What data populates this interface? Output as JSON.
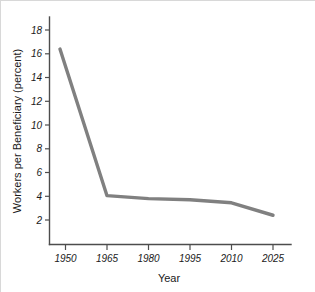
{
  "chart_data": {
    "type": "line",
    "title": "",
    "subtitle": "",
    "xlabel": "Year",
    "ylabel": "Workers per Beneficiary (percent)",
    "x": [
      1948,
      1965,
      1980,
      1995,
      2010,
      2025
    ],
    "values": [
      16.4,
      4.05,
      3.8,
      3.7,
      3.45,
      2.4
    ],
    "series": [
      {
        "name": "Workers per Beneficiary",
        "values": [
          16.4,
          4.05,
          3.8,
          3.7,
          3.45,
          2.4
        ]
      }
    ],
    "xtick_labels": [
      "1950",
      "1965",
      "1980",
      "1995",
      "2010",
      "2025"
    ],
    "xtick_values": [
      1950,
      1965,
      1980,
      1995,
      2010,
      2025
    ],
    "ytick_labels": [
      "2",
      "4",
      "6",
      "8",
      "10",
      "12",
      "14",
      "16",
      "18"
    ],
    "ytick_values": [
      2,
      4,
      6,
      8,
      10,
      12,
      14,
      16,
      18
    ],
    "xlim": [
      1943,
      2033
    ],
    "ylim": [
      0,
      19
    ],
    "grid": false,
    "legend": false,
    "legend_position": "none",
    "line_color": "#808080",
    "line_width": 3.4,
    "axis_color": "#4d4d4d",
    "background_color": "#ffffff",
    "border_color": "#d8d8d8"
  },
  "ytick_labels": {
    "t0": "2",
    "t1": "4",
    "t2": "6",
    "t3": "8",
    "t4": "10",
    "t5": "12",
    "t6": "14",
    "t7": "16",
    "t8": "18"
  },
  "xtick_labels": {
    "t0": "1950",
    "t1": "1965",
    "t2": "1980",
    "t3": "1995",
    "t4": "2010",
    "t5": "2025"
  },
  "axis_titles": {
    "x": "Year",
    "y": "Workers per Beneficiary (percent)"
  }
}
